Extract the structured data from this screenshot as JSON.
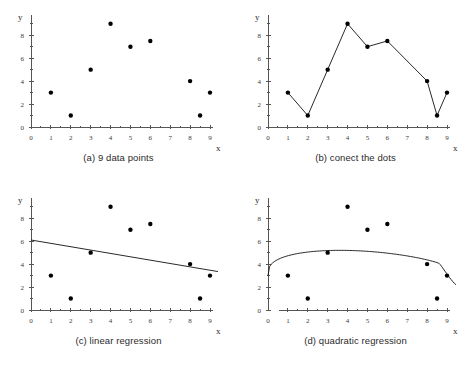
{
  "figure": {
    "background_color": "#ffffff",
    "marker_color": "#000000",
    "line_color": "#111111",
    "axis_color": "#555555"
  },
  "panels": [
    {
      "id": "a",
      "caption": "(a) 9 data points",
      "xlabel": "x",
      "ylabel": "y"
    },
    {
      "id": "b",
      "caption": "(b) conect the dots",
      "xlabel": "x",
      "ylabel": "y"
    },
    {
      "id": "c",
      "caption": "(c) linear regression",
      "xlabel": "x",
      "ylabel": "y"
    },
    {
      "id": "d",
      "caption": "(d) quadratic regression",
      "xlabel": "x",
      "ylabel": "y"
    }
  ],
  "chart_data": [
    {
      "type": "scatter",
      "title": "(a) 9 data points",
      "xlabel": "x",
      "ylabel": "y",
      "xlim": [
        0,
        9
      ],
      "ylim": [
        0,
        9.5
      ],
      "xticks": [
        0,
        1,
        2,
        3,
        4,
        5,
        6,
        7,
        8,
        9
      ],
      "yticks": [
        0,
        2,
        4,
        6,
        8
      ],
      "xtick_labels": [
        "0",
        "1",
        "2",
        "3",
        "4",
        "5",
        "6",
        "7",
        "8",
        "9"
      ],
      "ytick_labels": [
        "0",
        "2",
        "4",
        "6",
        "8"
      ],
      "minor_ticks": true,
      "grid": false,
      "legend": false,
      "x": [
        1,
        2,
        3,
        4,
        5,
        6,
        8,
        8.5,
        9
      ],
      "y": [
        3,
        1,
        5,
        9,
        7,
        7.5,
        4,
        1,
        3
      ]
    },
    {
      "type": "line",
      "title": "(b) conect the dots",
      "xlabel": "x",
      "ylabel": "y",
      "xlim": [
        0,
        9
      ],
      "ylim": [
        0,
        9.5
      ],
      "xticks": [
        0,
        1,
        2,
        3,
        4,
        5,
        6,
        7,
        8,
        9
      ],
      "yticks": [
        0,
        2,
        4,
        6,
        8
      ],
      "xtick_labels": [
        "0",
        "1",
        "2",
        "3",
        "4",
        "5",
        "6",
        "7",
        "8",
        "9"
      ],
      "ytick_labels": [
        "0",
        "2",
        "4",
        "6",
        "8"
      ],
      "minor_ticks": true,
      "grid": false,
      "legend": false,
      "markers": true,
      "x": [
        1,
        2,
        3,
        4,
        5,
        6,
        8,
        8.5,
        9
      ],
      "y": [
        3,
        1,
        5,
        9,
        7,
        7.5,
        4,
        1,
        3
      ]
    },
    {
      "type": "scatter",
      "title": "(c) linear regression",
      "xlabel": "x",
      "ylabel": "y",
      "xlim": [
        0,
        9
      ],
      "ylim": [
        0,
        9.5
      ],
      "xticks": [
        0,
        1,
        2,
        3,
        4,
        5,
        6,
        7,
        8,
        9
      ],
      "yticks": [
        0,
        2,
        4,
        6,
        8
      ],
      "xtick_labels": [
        "0",
        "1",
        "2",
        "3",
        "4",
        "5",
        "6",
        "7",
        "8",
        "9"
      ],
      "ytick_labels": [
        "0",
        "2",
        "4",
        "6",
        "8"
      ],
      "minor_ticks": true,
      "grid": false,
      "legend": false,
      "x": [
        1,
        2,
        3,
        4,
        5,
        6,
        8,
        8.5,
        9
      ],
      "y": [
        3,
        1,
        5,
        9,
        7,
        7.5,
        4,
        1,
        3
      ],
      "fit": {
        "kind": "linear",
        "x_start": 0,
        "x_end": 9.4,
        "y_start": 6.1,
        "y_end": 3.35
      }
    },
    {
      "type": "scatter",
      "title": "(d) quadratic regression",
      "xlabel": "x",
      "ylabel": "y",
      "xlim": [
        0,
        9
      ],
      "ylim": [
        0,
        9.5
      ],
      "xticks": [
        0,
        1,
        2,
        3,
        4,
        5,
        6,
        7,
        8,
        9
      ],
      "yticks": [
        0,
        2,
        4,
        6,
        8
      ],
      "xtick_labels": [
        "0",
        "1",
        "2",
        "3",
        "4",
        "5",
        "6",
        "7",
        "8",
        "9"
      ],
      "ytick_labels": [
        "0",
        "2",
        "4",
        "6",
        "8"
      ],
      "minor_ticks": true,
      "grid": false,
      "legend": false,
      "x": [
        1,
        2,
        3,
        4,
        5,
        6,
        8,
        8.5,
        9
      ],
      "y": [
        3,
        1,
        5,
        9,
        7,
        7.5,
        4,
        1,
        3
      ],
      "fit": {
        "kind": "quadratic-like",
        "x_start": 0,
        "x_end": 9.45,
        "peak_x": 4.0,
        "peak_y": 5.2,
        "y_start": 3.0,
        "y_end": 2.2
      }
    }
  ]
}
